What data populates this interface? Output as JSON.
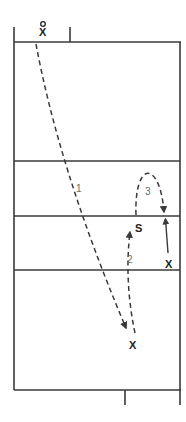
{
  "diagram": {
    "type": "volleyball-court-play",
    "markers": {
      "top_player": "X",
      "top_player_circle": "O",
      "setter": "S",
      "right_player": "X",
      "bottom_player": "X"
    },
    "paths": [
      {
        "id": "1",
        "label": "1",
        "style": "dashed",
        "from": "top-player",
        "to": "bottom-player"
      },
      {
        "id": "2",
        "label": "2",
        "style": "dashed",
        "from": "bottom-player",
        "to": "setter"
      },
      {
        "id": "3",
        "label": "3",
        "style": "dashed-arc",
        "from": "setter",
        "to": "right-player"
      },
      {
        "id": "4",
        "label": "",
        "style": "solid",
        "from": "right-player",
        "to": "net-right"
      }
    ],
    "colors": {
      "line": "#3a3a3a",
      "label": "#6a6a6a",
      "marker": "#222222"
    }
  }
}
